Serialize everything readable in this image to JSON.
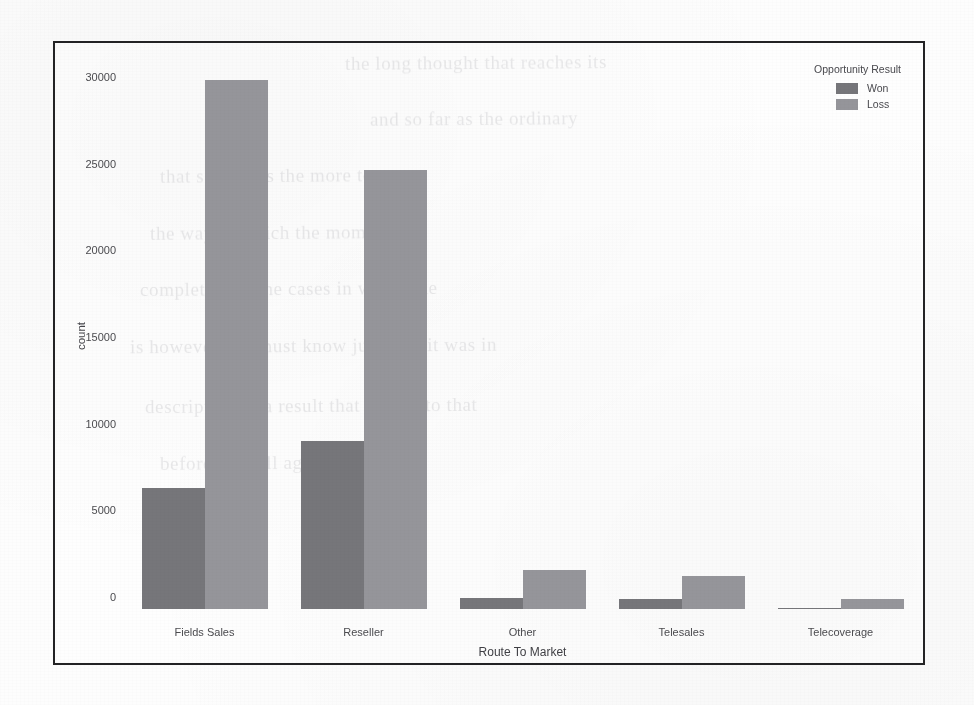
{
  "chart_data": {
    "type": "bar",
    "title": "",
    "xlabel": "Route To Market",
    "ylabel": "count",
    "categories": [
      "Fields Sales",
      "Reseller",
      "Other",
      "Telesales",
      "Telecoverage"
    ],
    "series": [
      {
        "name": "Won",
        "values": [
          7000,
          9700,
          640,
          580,
          80
        ],
        "color": "#76767a"
      },
      {
        "name": "Loss",
        "values": [
          30500,
          25300,
          2250,
          1900,
          550
        ],
        "color": "#95959a"
      }
    ],
    "ylim": [
      0,
      31500
    ],
    "yticks": [
      0,
      5000,
      10000,
      15000,
      20000,
      25000,
      30000
    ],
    "ytick_labels": [
      "0",
      "5000",
      "10000",
      "15000",
      "20000",
      "25000",
      "30000"
    ],
    "grid": false,
    "legend": {
      "title": "Opportunity Result",
      "position": "upper-right",
      "entries": [
        "Won",
        "Loss"
      ]
    }
  },
  "figure": {
    "frame_color": "#232325",
    "background_color": "#fdfdfd"
  },
  "background_text": [
    "the long thought that reaches its",
    "and so far as the ordinary",
    "that same was the more to",
    "the way in which the moment",
    "completed, or the cases in which the",
    "is however, we must know just how it was in",
    "description of a result that is held to that",
    "before we will again, for the full"
  ]
}
